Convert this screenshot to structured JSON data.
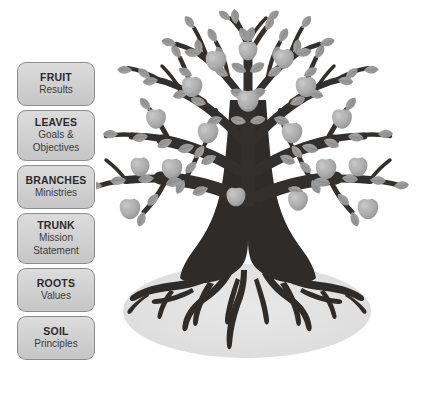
{
  "diagram": {
    "name": "organizational-tree-metaphor",
    "background_color": "#ffffff"
  },
  "legend": {
    "items": [
      {
        "title": "FRUIT",
        "subtitle": "Results",
        "lines": 2
      },
      {
        "title": "LEAVES",
        "subtitle": "Goals &\nObjectives",
        "lines": 3
      },
      {
        "title": "BRANCHES",
        "subtitle": "Ministries",
        "lines": 2
      },
      {
        "title": "TRUNK",
        "subtitle": "Mission\nStatement",
        "lines": 3
      },
      {
        "title": "ROOTS",
        "subtitle": "Values",
        "lines": 2
      },
      {
        "title": "SOIL",
        "subtitle": "Principles",
        "lines": 2
      }
    ],
    "box_fill_color": "#d4d4d4",
    "box_border_color": "#8d8d8d",
    "title_color": "#2b2b2b",
    "subtitle_color": "#3b3b3b"
  },
  "legend_lines": {
    "leaves_sub_1": "Goals &",
    "leaves_sub_2": "Objectives",
    "trunk_sub_1": "Mission",
    "trunk_sub_2": "Statement"
  },
  "tree": {
    "label": "tree-illustration",
    "trunk_color": "#2e2b29",
    "branch_color": "#332f2d",
    "leaf_color": "#9b9b9b",
    "leaf_edge_color": "#8a8a8a",
    "fruit_color": "#ababab",
    "fruit_highlight_color": "#c2c2c2",
    "soil_color": "#e2e2e2",
    "parts": [
      "canopy-branches",
      "leaves",
      "fruit-apples",
      "trunk",
      "roots",
      "soil-ellipse"
    ]
  }
}
